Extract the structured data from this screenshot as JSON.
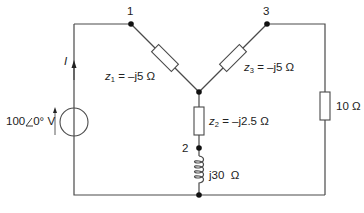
{
  "diagram": {
    "type": "circuit",
    "nodes": [
      {
        "id": "1",
        "label": "1"
      },
      {
        "id": "2",
        "label": "2"
      },
      {
        "id": "3",
        "label": "3"
      }
    ],
    "source": {
      "label_mag": "100",
      "label_angle": "0°",
      "label_unit": "V",
      "current_label": "I"
    },
    "components": {
      "z1": {
        "name": "z",
        "sub": "1",
        "value": "= –j5 Ω"
      },
      "z2": {
        "name": "z",
        "sub": "2",
        "value": "= –j2.5 Ω"
      },
      "z3": {
        "name": "z",
        "sub": "3",
        "value": "= –j5 Ω"
      },
      "inductor": {
        "value": "j30  Ω"
      },
      "resistor": {
        "value": "10 Ω"
      }
    },
    "colors": {
      "wire": "#4a4a4a",
      "node": "#111111",
      "background": "#ffffff"
    }
  }
}
